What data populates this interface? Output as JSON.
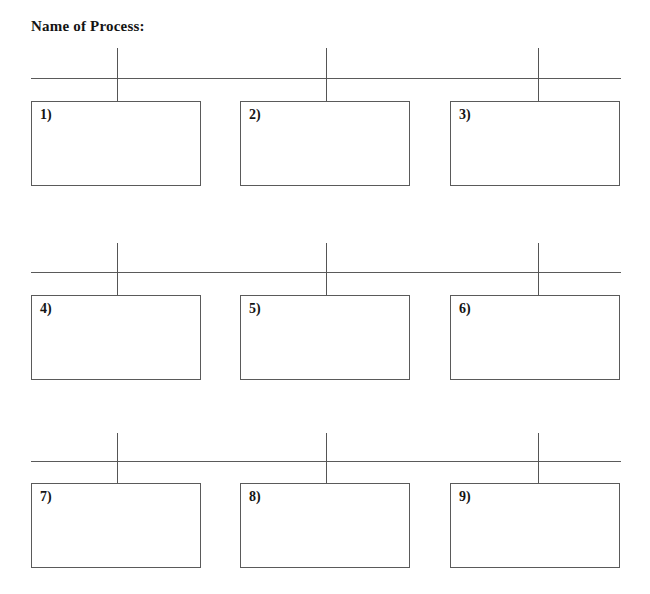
{
  "document": {
    "title": "Name of Process:",
    "background_color": "#ffffff",
    "line_color": "#5a5a5a",
    "text_color": "#141414",
    "width": 650,
    "height": 594
  },
  "rows": [
    {
      "id": "row-1",
      "timeline": {
        "axis": {
          "x": 31,
          "y": 78,
          "width": 590
        },
        "ticks": [
          {
            "x": 117,
            "top": 48,
            "height": 53
          },
          {
            "x": 326,
            "top": 48,
            "height": 53
          },
          {
            "x": 538,
            "top": 48,
            "height": 53
          }
        ]
      },
      "boxes": [
        {
          "label": "1)",
          "x": 31,
          "y": 101,
          "width": 170,
          "height": 85
        },
        {
          "label": "2)",
          "x": 240,
          "y": 101,
          "width": 170,
          "height": 85
        },
        {
          "label": "3)",
          "x": 450,
          "y": 101,
          "width": 170,
          "height": 85
        }
      ]
    },
    {
      "id": "row-2",
      "timeline": {
        "axis": {
          "x": 31,
          "y": 272,
          "width": 590
        },
        "ticks": [
          {
            "x": 117,
            "top": 243,
            "height": 52
          },
          {
            "x": 326,
            "top": 243,
            "height": 52
          },
          {
            "x": 538,
            "top": 243,
            "height": 52
          }
        ]
      },
      "boxes": [
        {
          "label": "4)",
          "x": 31,
          "y": 295,
          "width": 170,
          "height": 85
        },
        {
          "label": "5)",
          "x": 240,
          "y": 295,
          "width": 170,
          "height": 85
        },
        {
          "label": "6)",
          "x": 450,
          "y": 295,
          "width": 170,
          "height": 85
        }
      ]
    },
    {
      "id": "row-3",
      "timeline": {
        "axis": {
          "x": 31,
          "y": 461,
          "width": 590
        },
        "ticks": [
          {
            "x": 117,
            "top": 433,
            "height": 50
          },
          {
            "x": 326,
            "top": 433,
            "height": 50
          },
          {
            "x": 538,
            "top": 433,
            "height": 50
          }
        ]
      },
      "boxes": [
        {
          "label": "7)",
          "x": 31,
          "y": 483,
          "width": 170,
          "height": 85
        },
        {
          "label": "8)",
          "x": 240,
          "y": 483,
          "width": 170,
          "height": 85
        },
        {
          "label": "9)",
          "x": 450,
          "y": 483,
          "width": 170,
          "height": 85
        }
      ]
    }
  ]
}
